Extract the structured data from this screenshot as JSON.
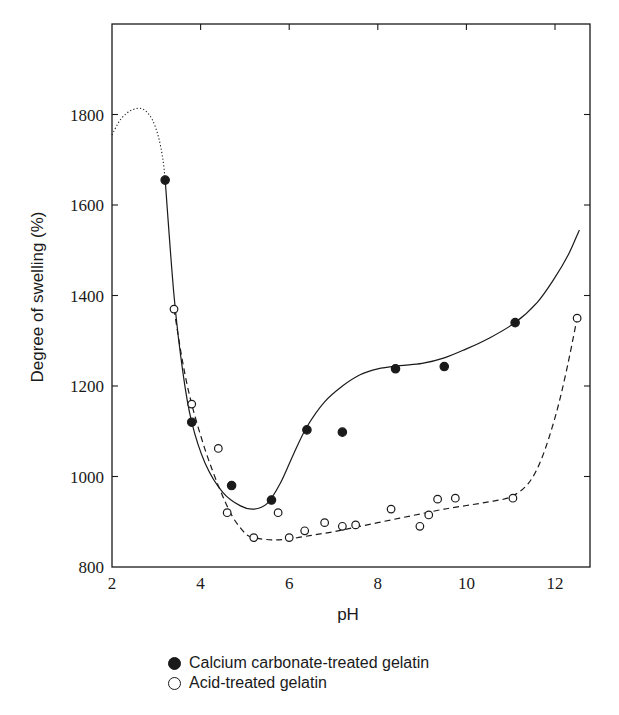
{
  "chart_data": {
    "type": "scatter",
    "title": "",
    "xlabel": "pH",
    "ylabel": "Degree of swelling (%)",
    "xlim": [
      2,
      12.8
    ],
    "ylim": [
      800,
      2000
    ],
    "xticks": [
      2,
      4,
      6,
      8,
      10,
      12
    ],
    "yticks": [
      800,
      1000,
      1200,
      1400,
      1600,
      1800
    ],
    "grid": false,
    "legend_position": "below",
    "series": [
      {
        "name": "Calcium carbonate-treated gelatin",
        "marker": "filled-circle",
        "line": "solid",
        "points": [
          [
            3.2,
            1655
          ],
          [
            3.8,
            1120
          ],
          [
            4.7,
            980
          ],
          [
            5.6,
            948
          ],
          [
            6.4,
            1103
          ],
          [
            7.2,
            1098
          ],
          [
            8.4,
            1238
          ],
          [
            9.5,
            1243
          ],
          [
            11.1,
            1340
          ]
        ],
        "curve": [
          [
            3.2,
            1655
          ],
          [
            3.4,
            1400
          ],
          [
            3.6,
            1230
          ],
          [
            3.8,
            1120
          ],
          [
            4.1,
            1030
          ],
          [
            4.5,
            965
          ],
          [
            4.9,
            935
          ],
          [
            5.2,
            928
          ],
          [
            5.5,
            940
          ],
          [
            5.8,
            985
          ],
          [
            6.1,
            1050
          ],
          [
            6.4,
            1110
          ],
          [
            6.8,
            1165
          ],
          [
            7.2,
            1200
          ],
          [
            7.6,
            1225
          ],
          [
            8.0,
            1238
          ],
          [
            8.5,
            1245
          ],
          [
            9.0,
            1250
          ],
          [
            9.5,
            1262
          ],
          [
            10.0,
            1282
          ],
          [
            10.5,
            1305
          ],
          [
            11.1,
            1340
          ],
          [
            11.6,
            1385
          ],
          [
            12.0,
            1440
          ],
          [
            12.3,
            1490
          ],
          [
            12.55,
            1545
          ]
        ],
        "extrapolation": [
          [
            2.0,
            1755
          ],
          [
            2.2,
            1790
          ],
          [
            2.45,
            1810
          ],
          [
            2.7,
            1812
          ],
          [
            2.9,
            1790
          ],
          [
            3.05,
            1750
          ],
          [
            3.15,
            1700
          ],
          [
            3.2,
            1655
          ]
        ]
      },
      {
        "name": "Acid-treated gelatin",
        "marker": "open-circle",
        "line": "dashed",
        "points": [
          [
            3.4,
            1370
          ],
          [
            3.8,
            1160
          ],
          [
            4.4,
            1062
          ],
          [
            4.6,
            920
          ],
          [
            5.2,
            865
          ],
          [
            5.75,
            920
          ],
          [
            6.0,
            865
          ],
          [
            6.35,
            880
          ],
          [
            6.8,
            898
          ],
          [
            7.2,
            890
          ],
          [
            7.5,
            893
          ],
          [
            8.3,
            928
          ],
          [
            8.95,
            890
          ],
          [
            9.15,
            915
          ],
          [
            9.35,
            950
          ],
          [
            9.75,
            952
          ],
          [
            11.05,
            952
          ],
          [
            12.5,
            1350
          ]
        ],
        "curve": [
          [
            3.4,
            1370
          ],
          [
            3.6,
            1250
          ],
          [
            3.8,
            1160
          ],
          [
            4.1,
            1060
          ],
          [
            4.4,
            980
          ],
          [
            4.7,
            915
          ],
          [
            5.0,
            875
          ],
          [
            5.2,
            865
          ],
          [
            5.6,
            860
          ],
          [
            6.0,
            862
          ],
          [
            6.5,
            870
          ],
          [
            7.0,
            878
          ],
          [
            7.5,
            888
          ],
          [
            8.0,
            898
          ],
          [
            8.5,
            908
          ],
          [
            9.0,
            918
          ],
          [
            9.5,
            928
          ],
          [
            10.0,
            936
          ],
          [
            10.5,
            944
          ],
          [
            11.0,
            955
          ],
          [
            11.4,
            985
          ],
          [
            11.7,
            1040
          ],
          [
            12.0,
            1130
          ],
          [
            12.25,
            1230
          ],
          [
            12.5,
            1350
          ]
        ]
      }
    ]
  },
  "axes": {
    "x_title": "pH",
    "y_title": "Degree of swelling (%)",
    "x_tick_labels": [
      "2",
      "4",
      "6",
      "8",
      "10",
      "12"
    ],
    "y_tick_labels": [
      "800",
      "1000",
      "1200",
      "1400",
      "1600",
      "1800"
    ]
  },
  "legend": {
    "items": [
      {
        "label": "Calcium carbonate-treated gelatin",
        "marker": "filled-circle"
      },
      {
        "label": "Acid-treated gelatin",
        "marker": "open-circle"
      }
    ]
  },
  "colors": {
    "ink": "#1a1a1a",
    "background": "#ffffff"
  }
}
